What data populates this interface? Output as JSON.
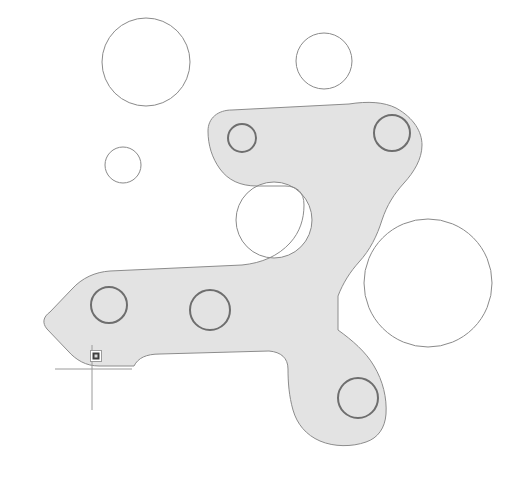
{
  "app": {
    "type": "cad-viewport",
    "title": "2D CAD Drawing Viewport",
    "background_color": "#ffffff"
  },
  "colors": {
    "part_fill": "#e3e3e3",
    "part_outline": "#8c8c8c",
    "circle_outline": "#8a8a8a",
    "bore_outline": "#6e6e6e",
    "crosshair": "#9a9a9a",
    "snap_marker_fill": "#9b9b9b",
    "snap_marker_inner": "#3f3f3f"
  },
  "geometry": {
    "part": {
      "name": "bracket-part-body",
      "fill": "#e3e3e3",
      "stroke": "#8c8c8c",
      "stroke_width": 1,
      "outline_path": "M 208 131 C 208 118 218 110 232 110 L 349 104 C 368 101 384 102 396 108 C 414 118 422 132 422 145 C 422 159 414 172 404 183 C 394 194 387 205 382 220 C 377 236 370 250 359 262 C 350 272 343 283 338 296 L 338 330 C 352 340 366 352 374 366 C 383 381 387 398 386 414 C 385 428 378 438 366 442 C 352 447 334 447 320 441 C 306 435 297 424 293 410 C 289 396 288 382 288 369 C 288 358 281 352 269 351 L 160 354 C 146 354 138 358 134 366 L 99 366 C 86 366 76 360 68 351 L 47 329 C 42 323 43 317 50 312 L 72 289 C 82 278 95 272 110 271 L 242 265 C 262 263 278 256 290 243 C 300 232 304 219 304 205 C 304 192 297 186 285 186 L 257 186 C 240 186 228 180 220 169 C 212 158 208 145 208 131 Z",
      "hole_in_part": {
        "name": "middle-void-circle",
        "cx": 274,
        "cy": 220,
        "r": 38
      }
    },
    "bores": [
      {
        "name": "bore-upper-left",
        "cx": 242,
        "cy": 138,
        "r": 14,
        "stroke": "#6e6e6e"
      },
      {
        "name": "bore-upper-right",
        "cx": 392,
        "cy": 133,
        "r": 18,
        "stroke": "#6e6e6e"
      },
      {
        "name": "bore-lower-left",
        "cx": 109,
        "cy": 305,
        "r": 18,
        "stroke": "#6e6e6e"
      },
      {
        "name": "bore-lower-middle",
        "cx": 210,
        "cy": 310,
        "r": 20,
        "stroke": "#6e6e6e"
      },
      {
        "name": "bore-lower-right",
        "cx": 358,
        "cy": 398,
        "r": 20,
        "stroke": "#6e6e6e"
      }
    ],
    "free_circles": [
      {
        "name": "circle-top-left",
        "cx": 146,
        "cy": 62,
        "r": 44,
        "stroke": "#8a8a8a"
      },
      {
        "name": "circle-top-right",
        "cx": 324,
        "cy": 61,
        "r": 28,
        "stroke": "#8a8a8a"
      },
      {
        "name": "circle-small-left",
        "cx": 123,
        "cy": 165,
        "r": 18,
        "stroke": "#8a8a8a"
      },
      {
        "name": "circle-center-void",
        "cx": 274,
        "cy": 220,
        "r": 38,
        "stroke": "#8a8a8a"
      },
      {
        "name": "circle-large-right",
        "cx": 428,
        "cy": 283,
        "r": 64,
        "stroke": "#8a8a8a"
      }
    ]
  },
  "cursor": {
    "name": "crosshair-cursor",
    "x": 92,
    "y": 369,
    "horizontal_span": [
      55,
      132
    ],
    "vertical_span": [
      345,
      410
    ],
    "color": "#9a9a9a"
  },
  "snap_marker": {
    "name": "osnap-insertion-marker",
    "x": 96,
    "y": 356,
    "size": 11,
    "outer_color": "#9b9b9b",
    "inner_color": "#3f3f3f"
  }
}
